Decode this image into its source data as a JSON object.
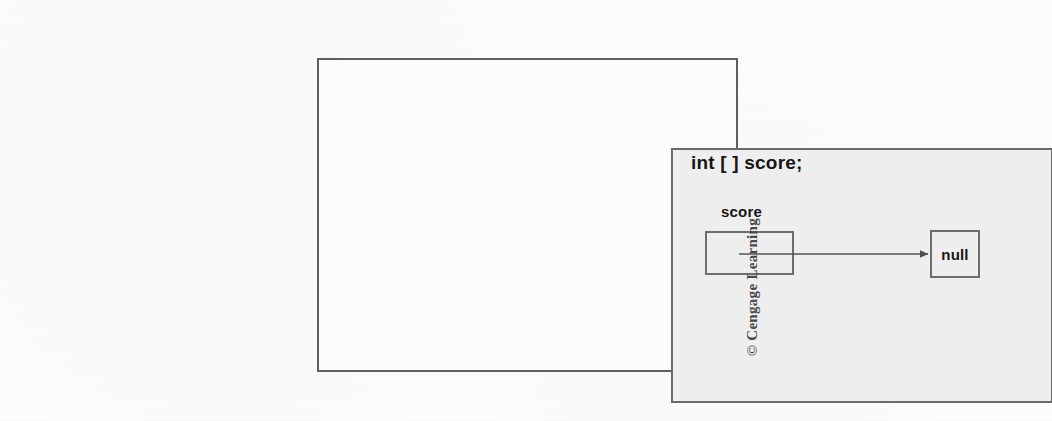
{
  "figure": {
    "kind": "memory-reference-diagram",
    "declaration": "int [ ] score;",
    "variable_label": "score",
    "pointer_target": "null",
    "arrow": {
      "semantic": "reference-arrow",
      "from": "score reference cell",
      "to": "null"
    },
    "credit": "© Cengage Learning",
    "colors": {
      "page_background": "#fdfdfd",
      "outer_frame_border": "#5f5f5f",
      "outer_frame_fill": "#fcfcfc",
      "inner_frame_border": "#6a6a6a",
      "inner_frame_fill": "#eeeeee",
      "box_border": "#6d6d6d",
      "text": "#161616",
      "arrow": "#555555",
      "credit_text": "#4a4a4a"
    }
  }
}
